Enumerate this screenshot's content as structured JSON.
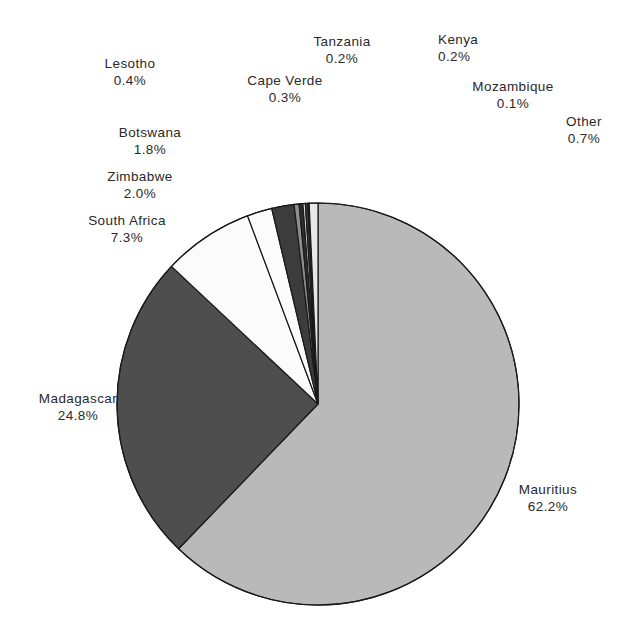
{
  "chart_data": {
    "type": "pie",
    "title": "",
    "subtitle": "",
    "xlabel": "",
    "ylabel": "",
    "legend_position": "none",
    "grid": false,
    "units": "percent",
    "total": 100.0,
    "start_angle_deg": 0,
    "direction": "clockwise",
    "categories": [
      "Mauritius",
      "Madagascar",
      "South Africa",
      "Zimbabwe",
      "Botswana",
      "Lesotho",
      "Cape Verde",
      "Tanzania",
      "Kenya",
      "Mozambique",
      "Other"
    ],
    "values": [
      62.2,
      24.8,
      7.3,
      2.0,
      1.8,
      0.4,
      0.3,
      0.2,
      0.2,
      0.1,
      0.7
    ],
    "slices": [
      {
        "label": "Mauritius",
        "value": 62.2,
        "text": "62.2%",
        "color": "#b9b9b9"
      },
      {
        "label": "Madagascar",
        "value": 24.8,
        "text": "24.8%",
        "color": "#4e4e4e"
      },
      {
        "label": "South Africa",
        "value": 7.3,
        "text": "7.3%",
        "color": "#fbfbfb"
      },
      {
        "label": "Zimbabwe",
        "value": 2.0,
        "text": "2.0%",
        "color": "#fbfbfb"
      },
      {
        "label": "Botswana",
        "value": 1.8,
        "text": "1.8%",
        "color": "#3c3c3c"
      },
      {
        "label": "Lesotho",
        "value": 0.4,
        "text": "0.4%",
        "color": "#8e8e8e"
      },
      {
        "label": "Cape Verde",
        "value": 0.3,
        "text": "0.3%",
        "color": "#2e2e2e"
      },
      {
        "label": "Tanzania",
        "value": 0.2,
        "text": "0.2%",
        "color": "#d6d6d6"
      },
      {
        "label": "Kenya",
        "value": 0.2,
        "text": "0.2%",
        "color": "#3c3c3c"
      },
      {
        "label": "Mozambique",
        "value": 0.1,
        "text": "0.1%",
        "color": "#9c9c9c"
      },
      {
        "label": "Other",
        "value": 0.7,
        "text": "0.7%",
        "color": "#e8e8e8"
      }
    ],
    "geometry": {
      "center_x": 318,
      "center_y": 404,
      "radius": 201,
      "stroke": "#1a1a1a",
      "stroke_width": 1.2
    }
  },
  "labels": {
    "lesotho": {
      "name": "Lesotho",
      "pct": "0.4%"
    },
    "cape_verde": {
      "name": "Cape Verde",
      "pct": "0.3%"
    },
    "tanzania": {
      "name": "Tanzania",
      "pct": "0.2%"
    },
    "kenya": {
      "name": "Kenya",
      "pct": "0.2%"
    },
    "mozambique": {
      "name": "Mozambique",
      "pct": "0.1%"
    },
    "other": {
      "name": "Other",
      "pct": "0.7%"
    },
    "botswana": {
      "name": "Botswana",
      "pct": "1.8%"
    },
    "zimbabwe": {
      "name": "Zimbabwe",
      "pct": "2.0%"
    },
    "south_africa": {
      "name": "South  Africa",
      "pct": "7.3%"
    },
    "madagascar": {
      "name": "Madagascar",
      "pct": "24.8%"
    },
    "mauritius": {
      "name": "Mauritius",
      "pct": "62.2%"
    }
  }
}
